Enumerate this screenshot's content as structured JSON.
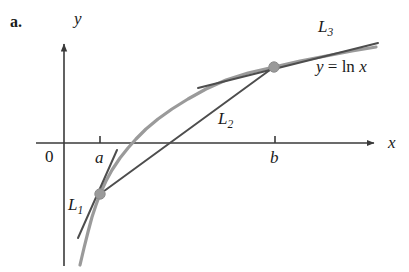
{
  "figure": {
    "part_label": "a."
  },
  "axes": {
    "y_axis_name": "y",
    "x_axis_name": "x",
    "origin_label": "0",
    "ticks": [
      {
        "name": "tick-a",
        "label": "a",
        "x_px": 100
      },
      {
        "name": "tick-b",
        "label": "b",
        "x_px": 275
      }
    ]
  },
  "labels": {
    "l1": {
      "base": "L",
      "sub": "1"
    },
    "l2": {
      "base": "L",
      "sub": "2"
    },
    "l3": {
      "base": "L",
      "sub": "3"
    },
    "function": {
      "y": "y",
      "equals": "=",
      "expr": "ln",
      "arg": "x"
    }
  },
  "colors": {
    "curve": "#9a9a9a",
    "line": "#4d4d4d",
    "axis": "#3a3a3a",
    "point": "#9a9a9a",
    "point_edge": "#8a8a8a",
    "text": "#1a1a1a",
    "background": "#ffffff"
  },
  "chart_data": {
    "type": "line",
    "title": "",
    "xlabel": "x",
    "ylabel": "y",
    "grid": false,
    "legend": false,
    "curves": [
      {
        "name": "y = ln x",
        "label": "y = ln x",
        "color": "#9a9a9a",
        "style": "solid",
        "width": 3.2,
        "points_px": [
          [
            80,
            265
          ],
          [
            84,
            248
          ],
          [
            88,
            232
          ],
          [
            92,
            217
          ],
          [
            96,
            205
          ],
          [
            100,
            194
          ],
          [
            106,
            181
          ],
          [
            112,
            170
          ],
          [
            120,
            158
          ],
          [
            128,
            148
          ],
          [
            136,
            139
          ],
          [
            146,
            129
          ],
          [
            158,
            119
          ],
          [
            172,
            109
          ],
          [
            188,
            99
          ],
          [
            206,
            89
          ],
          [
            226,
            80
          ],
          [
            248,
            73
          ],
          [
            274,
            67
          ],
          [
            300,
            61
          ],
          [
            326,
            56
          ],
          [
            352,
            51
          ],
          [
            376,
            47
          ]
        ]
      },
      {
        "name": "L1",
        "label": "L1",
        "role": "tangent at x = a",
        "color": "#4d4d4d",
        "style": "solid",
        "width": 2.0,
        "endpoints_px": [
          [
            78,
            238
          ],
          [
            117,
            150
          ]
        ]
      },
      {
        "name": "L2",
        "label": "L2",
        "role": "secant from (a, ln a) to (b, ln b)",
        "color": "#4d4d4d",
        "style": "solid",
        "width": 2.0,
        "endpoints_px": [
          [
            100,
            194
          ],
          [
            274,
            67
          ]
        ]
      },
      {
        "name": "L3",
        "label": "L3",
        "role": "tangent at x = b",
        "color": "#4d4d4d",
        "style": "solid",
        "width": 2.0,
        "endpoints_px": [
          [
            198,
            88
          ],
          [
            378,
            43
          ]
        ]
      }
    ],
    "points": [
      {
        "name": "point-a",
        "label": "(a, ln a)",
        "px": [
          100,
          194
        ],
        "r": 5.2,
        "color": "#9a9a9a"
      },
      {
        "name": "point-b",
        "label": "(b, ln b)",
        "px": [
          274,
          67
        ],
        "r": 5.2,
        "color": "#9a9a9a"
      }
    ],
    "axis_geometry_px": {
      "origin": [
        64,
        143
      ],
      "x_axis": [
        [
          36,
          143
        ],
        [
          380,
          143
        ]
      ],
      "y_axis": [
        [
          64,
          265
        ],
        [
          64,
          38
        ]
      ]
    }
  }
}
